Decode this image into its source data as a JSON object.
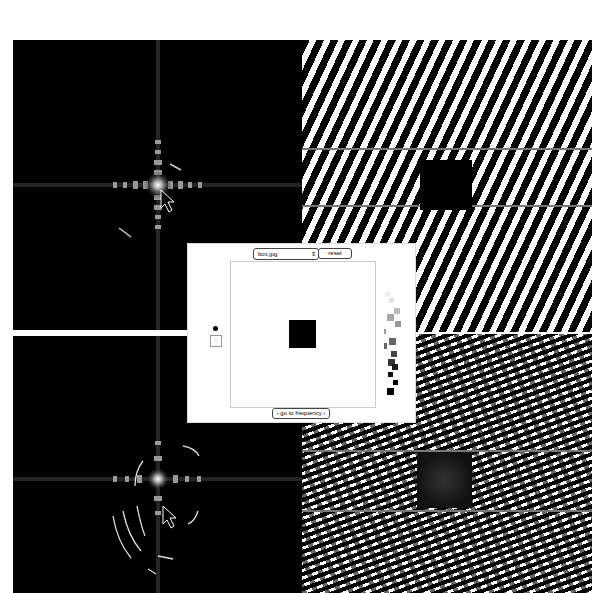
{
  "panels": {
    "top_left": {
      "kind": "frequency-spectrum"
    },
    "bottom_left": {
      "kind": "frequency-spectrum-edited"
    },
    "top_right": {
      "kind": "spatial-image"
    },
    "bottom_right": {
      "kind": "spatial-image-reconstructed"
    }
  },
  "dialog": {
    "image_select": {
      "value": "box.jpg",
      "arrow": "⇕"
    },
    "reset_label": "reset",
    "go_button_label": "› go to frequency ›",
    "tools": {
      "dot": "brush-dot-icon",
      "lasso": "lasso-select-icon",
      "lasso_glyph": "◌"
    },
    "palette": [
      "#eeeeee",
      "#e6e6e6",
      "#d0d0d0",
      "#b0b0b0",
      "#a0a0a0",
      "#9a9a9a",
      "#777777",
      "#707070",
      "#555555",
      "#444444",
      "#333333",
      "#222222",
      "#111111",
      "#000000",
      "#000000"
    ]
  },
  "colors": {
    "background": "#ffffff",
    "panel": "#000000",
    "dialog_bg": "#ffffff"
  }
}
